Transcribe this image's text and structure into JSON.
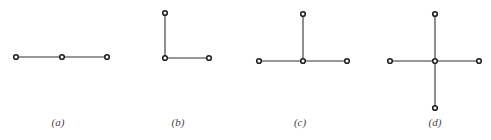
{
  "figures": [
    {
      "label": "(a)",
      "label_pos": [
        58,
        116
      ],
      "nodes": [
        [
          16,
          57
        ],
        [
          62,
          57
        ],
        [
          107,
          57
        ]
      ],
      "edges": [
        [
          0,
          1
        ],
        [
          1,
          2
        ]
      ]
    },
    {
      "label": "(b)",
      "label_pos": [
        178,
        116
      ],
      "nodes": [
        [
          165,
          13
        ],
        [
          165,
          58
        ],
        [
          209,
          58
        ]
      ],
      "edges": [
        [
          0,
          1
        ],
        [
          1,
          2
        ]
      ]
    },
    {
      "label": "(c)",
      "label_pos": [
        300,
        116
      ],
      "nodes": [
        [
          303,
          14
        ],
        [
          259,
          61
        ],
        [
          303,
          61
        ],
        [
          347,
          61
        ]
      ],
      "edges": [
        [
          0,
          2
        ],
        [
          1,
          2
        ],
        [
          2,
          3
        ]
      ]
    },
    {
      "label": "(d)",
      "label_pos": [
        435,
        116
      ],
      "nodes": [
        [
          435,
          14
        ],
        [
          390,
          61
        ],
        [
          435,
          61
        ],
        [
          479,
          61
        ],
        [
          435,
          108
        ]
      ],
      "edges": [
        [
          0,
          2
        ],
        [
          1,
          2
        ],
        [
          2,
          3
        ],
        [
          2,
          4
        ]
      ]
    }
  ]
}
